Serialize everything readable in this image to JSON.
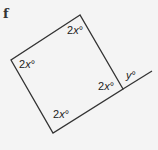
{
  "problem_label": "f",
  "angles": {
    "top": {
      "coef": "2",
      "var": "x",
      "unit": "°"
    },
    "left": {
      "coef": "2",
      "var": "x",
      "unit": "°"
    },
    "right": {
      "coef": "2",
      "var": "x",
      "unit": "°"
    },
    "bottom": {
      "coef": "2",
      "var": "x",
      "unit": "°"
    },
    "exterior": {
      "coef": "",
      "var": "y",
      "unit": "°"
    }
  },
  "colors": {
    "line": "#333333",
    "background": "#f4f4f4"
  }
}
